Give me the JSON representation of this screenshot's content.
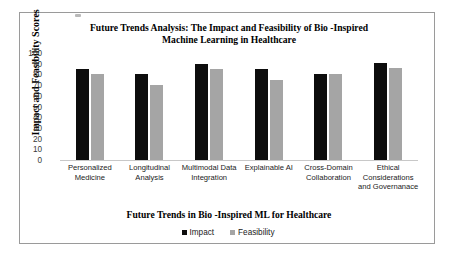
{
  "chart_data": {
    "type": "bar",
    "title": "Future Trends Analysis: The Impact and Feasibility of Bio -Inspired Machine Learning in Healthcare",
    "title_line1": "Future Trends Analysis: The Impact and Feasibility of Bio -Inspired",
    "title_line2": "Machine Learning in Healthcare",
    "xlabel": "Future Trends in Bio -Inspired ML for Healthcare",
    "ylabel": "Impact and Feasibility Scores",
    "ylim": [
      0,
      100
    ],
    "ytick_step": 10,
    "ytick_labels": [
      "100",
      "90",
      "80",
      "70",
      "60",
      "50",
      "40",
      "30",
      "20",
      "10",
      "0"
    ],
    "grid": false,
    "legend_position": "bottom",
    "categories": [
      "Personalized Medicine",
      "Longitudinal Analysis",
      "Multimodal Data Integration",
      "Explainable AI",
      "Cross-Domain Collaboration",
      "Ethical Considerations and Governanace"
    ],
    "category_lines": [
      [
        "Personalized",
        "Medicine"
      ],
      [
        "Longitudinal",
        "Analysis"
      ],
      [
        "Multimodal Data",
        "Integration"
      ],
      [
        "Explainable AI"
      ],
      [
        "Cross-Domain",
        "Collaboration"
      ],
      [
        "Ethical",
        "Considerations",
        "and Governanace"
      ]
    ],
    "series": [
      {
        "name": "Impact",
        "color": "#0d0d0d",
        "values": [
          85,
          80,
          90,
          85,
          80,
          91
        ]
      },
      {
        "name": "Feasibility",
        "color": "#a5a5a5",
        "values": [
          80,
          70,
          85,
          75,
          80,
          86
        ]
      }
    ]
  }
}
